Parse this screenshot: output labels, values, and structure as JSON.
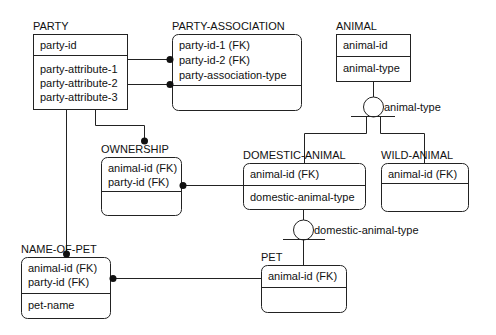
{
  "entities": {
    "party": {
      "name": "PARTY",
      "keys": [
        "party-id"
      ],
      "attributes": [
        "party-attribute-1",
        "party-attribute-2",
        "party-attribute-3"
      ]
    },
    "party_association": {
      "name": "PARTY-ASSOCIATION",
      "keys": [
        "party-id-1 (FK)",
        "party-id-2 (FK)",
        "party-association-type"
      ],
      "attributes": []
    },
    "animal": {
      "name": "ANIMAL",
      "keys": [
        "animal-id"
      ],
      "attributes": [
        "animal-type"
      ]
    },
    "ownership": {
      "name": "OWNERSHIP",
      "keys": [
        "animal-id (FK)",
        "party-id (FK)"
      ],
      "attributes": []
    },
    "domestic_animal": {
      "name": "DOMESTIC-ANIMAL",
      "keys": [
        "animal-id (FK)"
      ],
      "attributes": [
        "domestic-animal-type"
      ]
    },
    "wild_animal": {
      "name": "WILD-ANIMAL",
      "keys": [
        "animal-id (FK)"
      ],
      "attributes": []
    },
    "name_of_pet": {
      "name": "NAME-OF-PET",
      "keys": [
        "animal-id (FK)",
        "party-id (FK)"
      ],
      "attributes": [
        "pet-name"
      ]
    },
    "pet": {
      "name": "PET",
      "keys": [
        "animal-id (FK)"
      ],
      "attributes": []
    }
  },
  "discriminators": {
    "animal_type": "animal-type",
    "domestic_animal_type": "domestic-animal-type"
  },
  "colors": {
    "line": "#222222",
    "background": "#ffffff"
  }
}
